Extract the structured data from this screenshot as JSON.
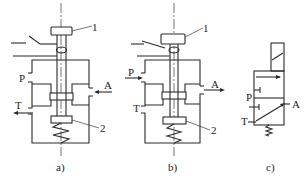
{
  "figure": {
    "panels": [
      {
        "id": "a",
        "caption": "a)",
        "callouts": {
          "part1": "1",
          "part2": "2"
        },
        "ports": {
          "pressure": "P",
          "work": "A",
          "tank": "T"
        }
      },
      {
        "id": "b",
        "caption": "b)",
        "callouts": {
          "part1": "1",
          "part2": "2"
        },
        "ports": {
          "pressure": "P",
          "work": "A",
          "tank": "T"
        }
      },
      {
        "id": "c",
        "caption": "c)",
        "ports": {
          "pressure": "P",
          "work": "A",
          "tank": "T"
        }
      }
    ],
    "colors": {
      "line": "#2a2a2a",
      "background": "#ffffff"
    }
  }
}
